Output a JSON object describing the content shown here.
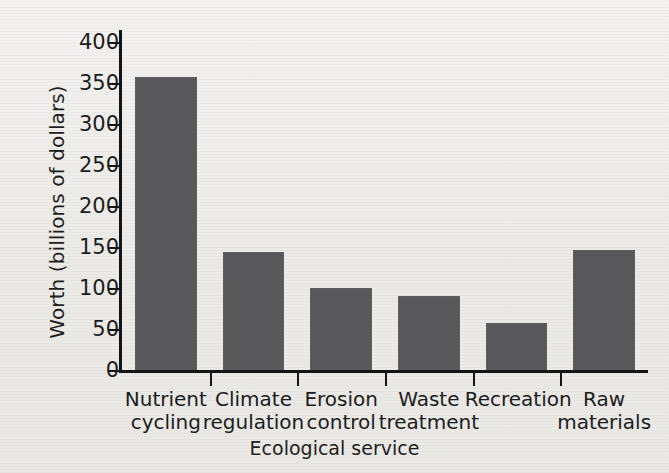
{
  "chart_data": {
    "type": "bar",
    "title": "",
    "categories": [
      "Nutrient cycling",
      "Climate regulation",
      "Erosion control",
      "Waste treatment",
      "Recreation",
      "Raw materials"
    ],
    "category_lines": [
      [
        "Nutrient",
        "cycling"
      ],
      [
        "Climate",
        "regulation"
      ],
      [
        "Erosion",
        "control"
      ],
      [
        "Waste",
        "treatment"
      ],
      [
        "Recreation",
        ""
      ],
      [
        "Raw",
        "materials"
      ]
    ],
    "values": [
      359,
      145,
      101,
      92,
      58,
      147
    ],
    "xlabel": "Ecological service",
    "ylabel": "Worth (billions of dollars)",
    "ylim": [
      0,
      400
    ],
    "ytick_values": [
      0,
      50,
      100,
      150,
      200,
      250,
      300,
      350,
      400
    ],
    "ytick_labels": [
      "0",
      "50",
      "100",
      "150",
      "200",
      "250",
      "300",
      "350",
      "400"
    ],
    "grid": false,
    "legend": false,
    "legend_position": "none",
    "bar_color": "#58585a",
    "axis_color": "#141414",
    "background_color": "#efeeec"
  }
}
